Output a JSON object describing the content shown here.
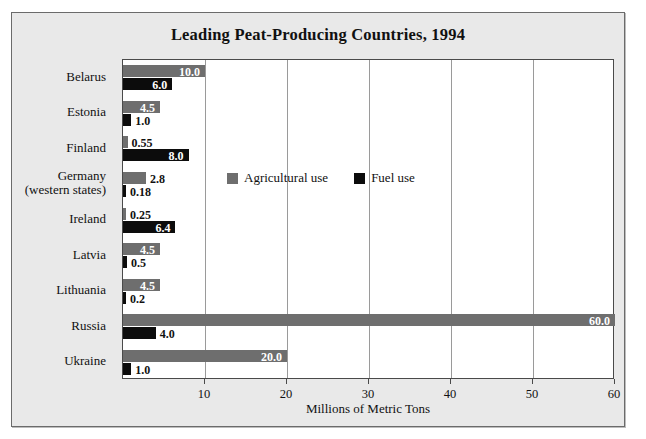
{
  "chart_data": {
    "type": "bar",
    "orientation": "horizontal",
    "title": "Leading Peat-Producing Countries, 1994",
    "xlabel": "Millions of Metric Tons",
    "ylabel": "",
    "xlim": [
      0,
      60
    ],
    "xticks": [
      10,
      20,
      30,
      40,
      50,
      60
    ],
    "xtick_labels": [
      "10",
      "20",
      "30",
      "40",
      "50",
      "60"
    ],
    "grid": true,
    "legend_position": "center",
    "categories": [
      "Belarus",
      "Estonia",
      "Finland",
      "Germany (western states)",
      "Ireland",
      "Latvia",
      "Lithuania",
      "Russia",
      "Ukraine"
    ],
    "series": [
      {
        "name": "Agricultural use",
        "color": "#6e6e6e",
        "values": [
          10.0,
          4.5,
          0.55,
          2.8,
          0.25,
          4.5,
          4.5,
          60.0,
          20.0
        ],
        "labels": [
          "10.0",
          "4.5",
          "0.55",
          "2.8",
          "0.25",
          "4.5",
          "4.5",
          "60.0",
          "20.0"
        ]
      },
      {
        "name": "Fuel use",
        "color": "#0c0c0c",
        "values": [
          6.0,
          1.0,
          8.0,
          0.18,
          6.4,
          0.5,
          0.2,
          4.0,
          1.0
        ],
        "labels": [
          "6.0",
          "1.0",
          "8.0",
          "0.18",
          "6.4",
          "0.5",
          "0.2",
          "4.0",
          "1.0"
        ]
      }
    ]
  },
  "rows": [
    {
      "label_line1": "Belarus",
      "label_line2": "",
      "agri_value": "10.0",
      "fuel_value": "6.0"
    },
    {
      "label_line1": "Estonia",
      "label_line2": "",
      "agri_value": "4.5",
      "fuel_value": "1.0"
    },
    {
      "label_line1": "Finland",
      "label_line2": "",
      "agri_value": "0.55",
      "fuel_value": "8.0"
    },
    {
      "label_line1": "Germany",
      "label_line2": "(western states)",
      "agri_value": "2.8",
      "fuel_value": "0.18"
    },
    {
      "label_line1": "Ireland",
      "label_line2": "",
      "agri_value": "0.25",
      "fuel_value": "6.4"
    },
    {
      "label_line1": "Latvia",
      "label_line2": "",
      "agri_value": "4.5",
      "fuel_value": "0.5"
    },
    {
      "label_line1": "Lithuania",
      "label_line2": "",
      "agri_value": "4.5",
      "fuel_value": "0.2"
    },
    {
      "label_line1": "Russia",
      "label_line2": "",
      "agri_value": "60.0",
      "fuel_value": "4.0"
    },
    {
      "label_line1": "Ukraine",
      "label_line2": "",
      "agri_value": "20.0",
      "fuel_value": "1.0"
    }
  ],
  "legend": {
    "items": [
      {
        "label": "Agricultural use",
        "swatch": "agri-swatch"
      },
      {
        "label": "Fuel use",
        "swatch": "fuel-swatch"
      }
    ]
  },
  "axis": {
    "tick_labels": [
      "10",
      "20",
      "30",
      "40",
      "50",
      "60"
    ],
    "x_title": "Millions of Metric Tons"
  },
  "title": "Leading Peat-Producing Countries, 1994"
}
